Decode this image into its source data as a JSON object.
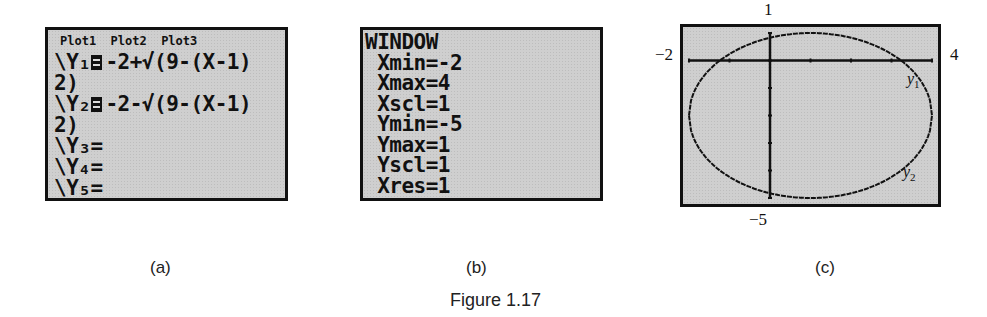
{
  "panels": {
    "a": {
      "sublabel": "(a)",
      "plots_header": "Plot1  Plot2  Plot3",
      "lines": [
        {
          "prefix": "\\Y₁",
          "eq": true,
          "text": "-2+√(9-(X-1)"
        },
        {
          "prefix": "2)",
          "eq": false,
          "text": ""
        },
        {
          "prefix": "\\Y₂",
          "eq": true,
          "text": "-2-√(9-(X-1)"
        },
        {
          "prefix": "2)",
          "eq": false,
          "text": ""
        },
        {
          "prefix": "\\Y₃=",
          "eq": false,
          "text": ""
        },
        {
          "prefix": "\\Y₄=",
          "eq": false,
          "text": ""
        },
        {
          "prefix": "\\Y₅=",
          "eq": false,
          "text": ""
        }
      ]
    },
    "b": {
      "sublabel": "(b)",
      "lines": [
        "WINDOW",
        " Xmin=-2",
        " Xmax=4",
        " Xscl=1",
        " Ymin=-5",
        " Ymax=1",
        " Yscl=1",
        " Xres=1"
      ]
    },
    "c": {
      "sublabel": "(c)",
      "label_top": "1",
      "label_bottom": "−5",
      "label_left": "−2",
      "label_right": "4",
      "curve_label_upper": "y",
      "curve_label_upper_sub": "1",
      "curve_label_lower": "y",
      "curve_label_lower_sub": "2"
    }
  },
  "caption": "Figure 1.17",
  "chart_data": {
    "type": "line",
    "series": [
      {
        "name": "y1",
        "formula": "-2+sqrt(9-(x-1)^2)"
      },
      {
        "name": "y2",
        "formula": "-2-sqrt(9-(x-1)^2)"
      }
    ],
    "xlim": [
      -2,
      4
    ],
    "ylim": [
      -5,
      1
    ],
    "xscl": 1,
    "yscl": 1,
    "xres": 1,
    "tick_labels": {
      "top": "1",
      "bottom": "-5",
      "left": "-2",
      "right": "4"
    }
  }
}
